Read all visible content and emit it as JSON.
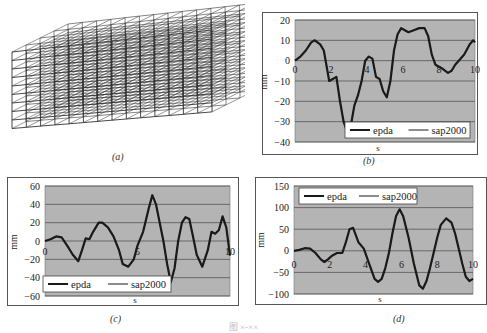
{
  "figure": {
    "captions": {
      "a": "(a)",
      "b": "(b)",
      "c": "(c)",
      "d": "(d)"
    },
    "bottom_caption": "图 ×-××",
    "panel_a": {
      "description": "3D wireframe frame-structure model (building)"
    }
  },
  "colors": {
    "plot_bg": "#b4b4b4",
    "grid": "#555555",
    "line": "#1a1a1a",
    "frame": "#555555"
  },
  "chart_data": [
    {
      "id": "b",
      "type": "line",
      "title": "",
      "xlabel": "s",
      "ylabel": "mm",
      "xlim": [
        0,
        10
      ],
      "ylim": [
        -40,
        20
      ],
      "xticks": [
        "0",
        "2",
        "4",
        "6",
        "8",
        "10"
      ],
      "yticks": [
        "20",
        "10",
        "0",
        "-10",
        "-20",
        "-30",
        "-40"
      ],
      "grid": true,
      "legend": {
        "entries": [
          "epda",
          "sap2000"
        ],
        "position": "lower right"
      },
      "x": [
        0,
        0.3,
        0.6,
        0.9,
        1.1,
        1.4,
        1.6,
        1.8,
        1.9,
        2.1,
        2.3,
        2.5,
        2.7,
        2.9,
        3.1,
        3.3,
        3.5,
        3.7,
        3.9,
        4.1,
        4.3,
        4.5,
        4.7,
        4.9,
        5.1,
        5.3,
        5.5,
        5.7,
        5.9,
        6.1,
        6.3,
        6.6,
        6.9,
        7.2,
        7.4,
        7.6,
        7.8,
        8.0,
        8.2,
        8.5,
        8.7,
        8.9,
        9.1,
        9.4,
        9.7,
        9.9,
        10.0
      ],
      "series": [
        {
          "name": "epda",
          "values": [
            0,
            2,
            5,
            9,
            10,
            8,
            5,
            -5,
            -10,
            -9,
            -8,
            -20,
            -30,
            -35,
            -32,
            -22,
            -17,
            -10,
            0,
            2,
            1,
            -8,
            -9,
            -15,
            -18,
            -10,
            5,
            13,
            16,
            15,
            14,
            15,
            16,
            16,
            12,
            3,
            -2,
            -3,
            -4,
            -6,
            -5,
            -2,
            0,
            3,
            8,
            10,
            9
          ]
        },
        {
          "name": "sap2000",
          "values": [
            0,
            2,
            5,
            9,
            10,
            8,
            5,
            -5,
            -10,
            -9,
            -8,
            -20,
            -30,
            -35,
            -32,
            -22,
            -17,
            -10,
            0,
            2,
            1,
            -8,
            -9,
            -15,
            -18,
            -10,
            5,
            13,
            16,
            15,
            14,
            15,
            16,
            16,
            12,
            3,
            -2,
            -3,
            -4,
            -6,
            -5,
            -2,
            0,
            3,
            8,
            10,
            9
          ]
        }
      ]
    },
    {
      "id": "c",
      "type": "line",
      "title": "",
      "xlabel": "s",
      "ylabel": "mm",
      "xlim": [
        0,
        10
      ],
      "ylim": [
        -60,
        60
      ],
      "xticks": [
        "0",
        "5",
        "10"
      ],
      "yticks": [
        "60",
        "40",
        "20",
        "0",
        "-20",
        "-40",
        "-60"
      ],
      "grid": true,
      "legend": {
        "entries": [
          "epda",
          "sap2000"
        ],
        "position": "lower left"
      },
      "x": [
        0,
        0.3,
        0.6,
        0.9,
        1.2,
        1.5,
        1.8,
        2.0,
        2.2,
        2.4,
        2.6,
        2.9,
        3.1,
        3.4,
        3.7,
        4.0,
        4.2,
        4.5,
        4.8,
        5.0,
        5.3,
        5.6,
        5.8,
        6.0,
        6.2,
        6.4,
        6.6,
        6.8,
        7.0,
        7.2,
        7.4,
        7.6,
        7.8,
        8.0,
        8.2,
        8.5,
        8.8,
        9.0,
        9.2,
        9.4,
        9.6,
        9.8,
        10.0
      ],
      "series": [
        {
          "name": "epda",
          "values": [
            0,
            2,
            5,
            4,
            -5,
            -15,
            -22,
            -10,
            3,
            2,
            10,
            20,
            20,
            15,
            5,
            -10,
            -25,
            -28,
            -20,
            -5,
            10,
            35,
            50,
            40,
            20,
            0,
            -25,
            -45,
            -30,
            0,
            20,
            26,
            24,
            5,
            -15,
            -28,
            -10,
            10,
            8,
            12,
            27,
            15,
            -16
          ]
        },
        {
          "name": "sap2000",
          "values": [
            0,
            2,
            5,
            4,
            -5,
            -15,
            -22,
            -10,
            3,
            2,
            10,
            20,
            20,
            15,
            5,
            -10,
            -25,
            -28,
            -20,
            -5,
            10,
            35,
            50,
            40,
            20,
            0,
            -25,
            -45,
            -30,
            0,
            20,
            26,
            24,
            5,
            -15,
            -28,
            -10,
            10,
            8,
            12,
            27,
            15,
            -16
          ]
        }
      ]
    },
    {
      "id": "d",
      "type": "line",
      "title": "",
      "xlabel": "s",
      "ylabel": "mm",
      "xlim": [
        0,
        10
      ],
      "ylim": [
        -100,
        150
      ],
      "xticks": [
        "0",
        "2",
        "4",
        "6",
        "8",
        "10"
      ],
      "yticks": [
        "150",
        "100",
        "50",
        "0",
        "-50",
        "-100"
      ],
      "grid": true,
      "legend": {
        "entries": [
          "epda",
          "sap2000"
        ],
        "position": "upper left"
      },
      "x": [
        0,
        0.3,
        0.6,
        0.9,
        1.2,
        1.5,
        1.7,
        1.9,
        2.1,
        2.4,
        2.7,
        2.9,
        3.1,
        3.3,
        3.6,
        3.9,
        4.2,
        4.5,
        4.7,
        4.9,
        5.1,
        5.3,
        5.5,
        5.7,
        5.9,
        6.1,
        6.4,
        6.7,
        7.0,
        7.2,
        7.4,
        7.6,
        7.8,
        8.0,
        8.2,
        8.5,
        8.8,
        9.0,
        9.2,
        9.4,
        9.6,
        9.8,
        10.0
      ],
      "series": [
        {
          "name": "epda",
          "values": [
            0,
            2,
            6,
            5,
            -5,
            -20,
            -26,
            -20,
            -12,
            -5,
            -5,
            20,
            50,
            53,
            20,
            5,
            -30,
            -65,
            -72,
            -65,
            -40,
            -5,
            40,
            80,
            96,
            80,
            30,
            -30,
            -80,
            -88,
            -70,
            -40,
            -5,
            30,
            60,
            75,
            65,
            40,
            5,
            -30,
            -60,
            -70,
            -65
          ]
        },
        {
          "name": "sap2000",
          "values": [
            0,
            2,
            6,
            5,
            -5,
            -20,
            -26,
            -20,
            -12,
            -5,
            -5,
            20,
            50,
            53,
            20,
            5,
            -30,
            -65,
            -72,
            -65,
            -40,
            -5,
            40,
            80,
            96,
            80,
            30,
            -30,
            -80,
            -88,
            -70,
            -40,
            -5,
            30,
            60,
            75,
            65,
            40,
            5,
            -30,
            -60,
            -70,
            -65
          ]
        }
      ]
    }
  ]
}
